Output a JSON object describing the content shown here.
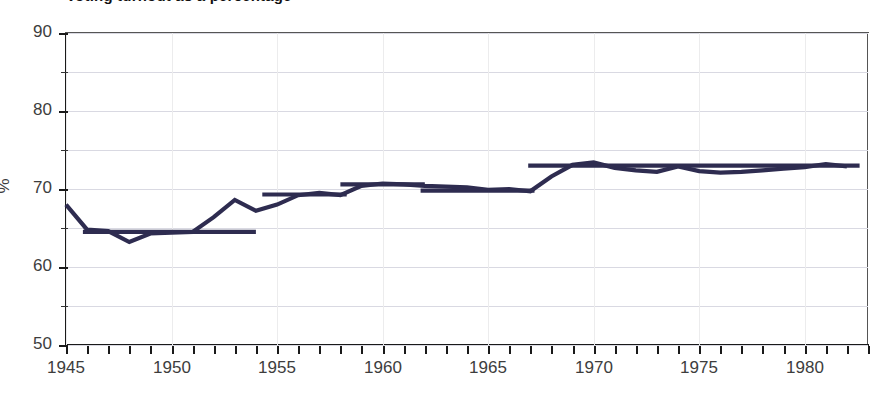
{
  "title": {
    "text": "Voting turnout as a percentage",
    "clipped": true
  },
  "axis": {
    "y_unit": "%",
    "y_labels": [
      "90",
      "80",
      "70",
      "60",
      "50"
    ],
    "y_values": [
      90,
      80,
      70,
      60,
      50
    ],
    "y_minor_values": [
      85,
      75,
      65,
      55
    ],
    "x_labels": [
      "1945",
      "1950",
      "1955",
      "1960",
      "1965",
      "1970",
      "1975",
      "1980"
    ],
    "x_label_values": [
      1945,
      1950,
      1955,
      1960,
      1965,
      1970,
      1975,
      1980
    ]
  },
  "colors": {
    "series": "#2e2c50",
    "grid": "#d9d9e2",
    "vgrid": "#ececed",
    "axis": "#1a1a1a",
    "text": "#3d3d3d"
  },
  "chart_data": {
    "type": "line",
    "title": "Voting turnout as a percentage",
    "xlabel": "",
    "ylabel": "%",
    "xlim": [
      1945,
      1983
    ],
    "ylim": [
      50,
      90
    ],
    "grid": true,
    "legend": "none",
    "x": [
      1945,
      1946,
      1947,
      1948,
      1949,
      1950,
      1951,
      1952,
      1953,
      1954,
      1955,
      1956,
      1957,
      1958,
      1959,
      1960,
      1961,
      1962,
      1963,
      1964,
      1965,
      1966,
      1967,
      1968,
      1969,
      1970,
      1971,
      1972,
      1973,
      1974,
      1975,
      1976,
      1977,
      1978,
      1979,
      1980,
      1981,
      1982
    ],
    "series": [
      {
        "name": "Turnout",
        "values": [
          68.0,
          64.8,
          64.6,
          63.2,
          64.3,
          64.4,
          64.5,
          66.4,
          68.6,
          67.2,
          68.0,
          69.2,
          69.5,
          69.2,
          70.4,
          70.7,
          70.6,
          70.4,
          70.3,
          70.2,
          69.9,
          70.0,
          69.7,
          71.6,
          73.1,
          73.4,
          72.7,
          72.4,
          72.2,
          72.9,
          72.3,
          72.1,
          72.2,
          72.4,
          72.6,
          72.8,
          73.2,
          72.9
        ]
      }
    ],
    "trend_segments": [
      {
        "x_start": 1945.8,
        "x_end": 1954.0,
        "value": 64.5
      },
      {
        "x_start": 1954.3,
        "x_end": 1958.3,
        "value": 69.3
      },
      {
        "x_start": 1958.0,
        "x_end": 1962.0,
        "value": 70.6
      },
      {
        "x_start": 1961.8,
        "x_end": 1967.2,
        "value": 69.8
      },
      {
        "x_start": 1966.9,
        "x_end": 1982.6,
        "value": 73.0
      }
    ]
  }
}
